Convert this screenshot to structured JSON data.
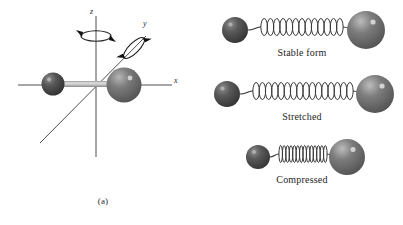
{
  "figure": {
    "type": "physics-diagram",
    "background_color": "#ffffff"
  },
  "panel_a": {
    "label": "(a)",
    "axes": [
      {
        "name": "z",
        "label": "z",
        "direction": "vertical",
        "italic": true
      },
      {
        "name": "y",
        "label": "y",
        "direction": "diagonal",
        "italic": true
      },
      {
        "name": "x",
        "label": "x",
        "direction": "horizontal",
        "italic": true
      }
    ],
    "rotation_arrows": [
      {
        "name": "rotation-about-z",
        "axis": "z"
      },
      {
        "name": "rotation-about-y",
        "axis": "y"
      }
    ],
    "atoms": [
      {
        "name": "small-atom",
        "radius": 11,
        "cx": 53,
        "cy": 84,
        "color": "#4a4a4a",
        "highlight": "#9a9a9a"
      },
      {
        "name": "large-atom",
        "radius": 17,
        "cx": 124,
        "cy": 85,
        "color": "#6e6e6e",
        "highlight": "#bdbdbd"
      }
    ],
    "bond": {
      "name": "rigid-bond",
      "color": "#b5b5b5"
    }
  },
  "panel_b": {
    "label": "(b)",
    "rows": [
      {
        "name": "stable-form",
        "caption": "Stable form",
        "coils": 13,
        "spring_width": 128,
        "left_atom": {
          "cx": 34,
          "cy": 30,
          "r": 13,
          "color": "#4f4f4f",
          "highlight": "#9e9e9e"
        },
        "right_atom": {
          "cx": 165,
          "cy": 30,
          "r": 19,
          "color": "#6b6b6b",
          "highlight": "#c0c0c0"
        }
      },
      {
        "name": "stretched",
        "caption": "Stretched",
        "coils": 16,
        "spring_width": 150,
        "left_atom": {
          "cx": 26,
          "cy": 30,
          "r": 13,
          "color": "#4f4f4f",
          "highlight": "#9e9e9e"
        },
        "right_atom": {
          "cx": 174,
          "cy": 30,
          "r": 19,
          "color": "#6b6b6b",
          "highlight": "#c0c0c0"
        }
      },
      {
        "name": "compressed",
        "caption": "Compressed",
        "coils": 14,
        "spring_width": 88,
        "left_atom": {
          "cx": 57,
          "cy": 30,
          "r": 12,
          "color": "#4f4f4f",
          "highlight": "#9e9e9e"
        },
        "right_atom": {
          "cx": 146,
          "cy": 30,
          "r": 18,
          "color": "#6b6b6b",
          "highlight": "#c0c0c0"
        }
      }
    ],
    "spring_color": "#3a3a3a",
    "tail_color": "#3a3a3a"
  },
  "colors": {
    "axis_line": "#3a3a3a",
    "small_atom": "#4a4a4a",
    "large_atom": "#6e6e6e",
    "bond": "#b5b5b5",
    "text": "#242424"
  }
}
